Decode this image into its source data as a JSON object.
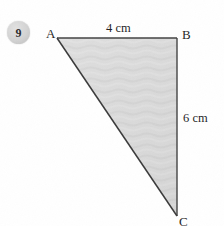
{
  "question": {
    "number": "9",
    "badge_color": "#d3d3d3"
  },
  "figure": {
    "type": "right-triangle",
    "fill_color": "#d9d9d9",
    "stroke_color": "#3a3a3a",
    "vertices": {
      "a_label": "A",
      "b_label": "B",
      "c_label": "C"
    },
    "dimensions": {
      "top_side": "4 cm",
      "right_side": "6 cm"
    }
  }
}
